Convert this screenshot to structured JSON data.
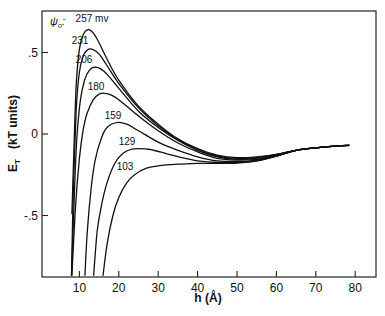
{
  "chart_data": {
    "type": "line",
    "title": "",
    "xlabel": "h (Å)",
    "ylabel": "E_T (kT units)",
    "xlim": [
      0,
      85
    ],
    "ylim": [
      -0.87,
      0.76
    ],
    "xticks": [
      10,
      20,
      30,
      40,
      50,
      60,
      70,
      80
    ],
    "xtick_labels": [
      "10",
      "20",
      "30",
      "40",
      "50",
      "60",
      "70",
      "80"
    ],
    "yticks": [
      0.5,
      0,
      -0.5
    ],
    "ytick_labels": [
      ".5",
      "0",
      "-.5"
    ],
    "grid": false,
    "legend_title": "ψ₀:",
    "legend_unit": "mv",
    "series": [
      {
        "name": "257 mv",
        "label": "257 mv",
        "x": [
          8.1,
          8.6,
          9.2,
          10.0,
          11.0,
          12.2,
          13.5,
          15,
          17,
          20,
          25,
          30,
          35,
          40,
          45,
          50,
          55,
          60,
          65,
          70,
          75,
          78.5
        ],
        "y": [
          -0.49,
          -0.1,
          0.3,
          0.52,
          0.61,
          0.64,
          0.62,
          0.56,
          0.46,
          0.33,
          0.17,
          0.06,
          -0.03,
          -0.09,
          -0.13,
          -0.145,
          -0.14,
          -0.125,
          -0.1,
          -0.085,
          -0.075,
          -0.07
        ]
      },
      {
        "name": "231",
        "label": "231",
        "x": [
          8.0,
          8.5,
          9.2,
          10.0,
          11.0,
          12.0,
          13.2,
          15,
          17,
          20,
          25,
          30,
          35,
          40,
          45,
          50,
          55,
          60,
          65,
          70,
          75,
          78.5
        ],
        "y": [
          -0.87,
          -0.3,
          0.15,
          0.38,
          0.48,
          0.515,
          0.52,
          0.49,
          0.42,
          0.31,
          0.16,
          0.05,
          -0.035,
          -0.095,
          -0.135,
          -0.15,
          -0.145,
          -0.125,
          -0.1,
          -0.085,
          -0.075,
          -0.07
        ]
      },
      {
        "name": "206",
        "label": "206",
        "x": [
          8.0,
          8.6,
          9.3,
          10.2,
          11.3,
          12.5,
          14.0,
          16,
          18,
          20,
          25,
          30,
          35,
          40,
          45,
          50,
          55,
          60,
          65,
          70,
          75,
          78.5
        ],
        "y": [
          -0.87,
          -0.45,
          -0.05,
          0.2,
          0.33,
          0.39,
          0.41,
          0.39,
          0.34,
          0.28,
          0.14,
          0.04,
          -0.04,
          -0.1,
          -0.14,
          -0.155,
          -0.15,
          -0.13,
          -0.1,
          -0.085,
          -0.075,
          -0.07
        ]
      },
      {
        "name": "180",
        "label": "180",
        "x": [
          8.1,
          9.0,
          10.0,
          11.0,
          12.0,
          13.5,
          15.0,
          16.5,
          18,
          20,
          25,
          30,
          35,
          40,
          45,
          50,
          55,
          60,
          65,
          70,
          75,
          78.5
        ],
        "y": [
          -0.87,
          -0.45,
          -0.15,
          0.03,
          0.13,
          0.21,
          0.245,
          0.25,
          0.24,
          0.21,
          0.11,
          0.02,
          -0.055,
          -0.11,
          -0.15,
          -0.16,
          -0.155,
          -0.13,
          -0.1,
          -0.085,
          -0.075,
          -0.07
        ]
      },
      {
        "name": "159",
        "label": "159",
        "x": [
          11.4,
          12.0,
          13.0,
          14.0,
          15.5,
          17.0,
          19.5,
          22,
          25,
          30,
          35,
          40,
          45,
          50,
          55,
          60,
          65,
          70,
          75,
          78.5
        ],
        "y": [
          -0.87,
          -0.6,
          -0.33,
          -0.16,
          -0.03,
          0.04,
          0.07,
          0.06,
          0.02,
          -0.05,
          -0.1,
          -0.14,
          -0.165,
          -0.17,
          -0.16,
          -0.135,
          -0.1,
          -0.085,
          -0.075,
          -0.07
        ]
      },
      {
        "name": "129",
        "label": "129",
        "x": [
          13.6,
          14.5,
          15.5,
          17,
          19,
          21,
          23,
          25,
          28,
          32,
          36,
          40,
          45,
          50,
          55,
          60,
          65,
          70,
          75,
          78.5
        ],
        "y": [
          -0.87,
          -0.6,
          -0.45,
          -0.3,
          -0.18,
          -0.12,
          -0.095,
          -0.09,
          -0.095,
          -0.12,
          -0.145,
          -0.165,
          -0.175,
          -0.175,
          -0.165,
          -0.135,
          -0.1,
          -0.085,
          -0.075,
          -0.07
        ]
      },
      {
        "name": "103",
        "label": "103",
        "x": [
          16.0,
          17.0,
          18.5,
          20,
          22,
          24,
          27,
          30,
          35,
          40,
          45,
          50,
          55,
          60,
          65,
          70,
          75,
          78.5
        ],
        "y": [
          -0.87,
          -0.68,
          -0.5,
          -0.39,
          -0.3,
          -0.25,
          -0.21,
          -0.195,
          -0.185,
          -0.18,
          -0.18,
          -0.178,
          -0.165,
          -0.135,
          -0.1,
          -0.085,
          -0.075,
          -0.07
        ]
      }
    ]
  },
  "labels": {
    "psi": "ψ",
    "psi_sub": "o",
    "psi_colon": ":",
    "xlabel": "h (Å)",
    "ylabel_main": "E",
    "ylabel_sub": "T",
    "ylabel_units": "(kT units)"
  },
  "curve_label_positions": [
    {
      "text": "257 mv",
      "x": 92,
      "y": 22
    },
    {
      "text": "231",
      "x": 80,
      "y": 44
    },
    {
      "text": "206",
      "x": 84,
      "y": 63
    },
    {
      "text": "180",
      "x": 96,
      "y": 90
    },
    {
      "text": "159",
      "x": 113,
      "y": 119
    },
    {
      "text": "129",
      "x": 127,
      "y": 145
    },
    {
      "text": "103",
      "x": 125,
      "y": 170
    }
  ]
}
